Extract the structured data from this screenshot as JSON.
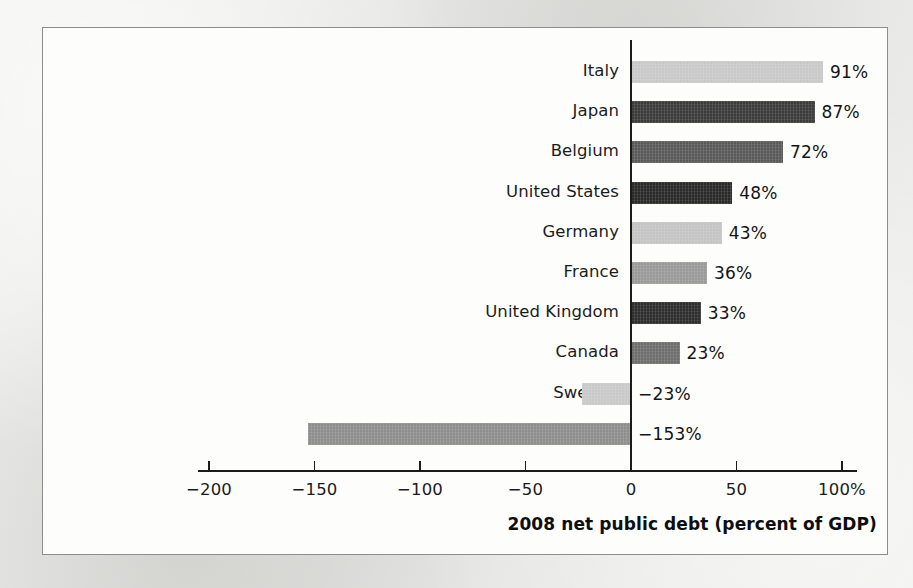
{
  "chart_data": {
    "type": "bar",
    "orientation": "horizontal",
    "title": "",
    "xlabel": "2008 net public debt (percent of GDP)",
    "ylabel": "",
    "categories": [
      "Italy",
      "Japan",
      "Belgium",
      "United States",
      "Germany",
      "France",
      "United Kingdom",
      "Canada",
      "Sweden",
      "Norway"
    ],
    "values": [
      91,
      87,
      72,
      48,
      43,
      36,
      33,
      23,
      -23,
      -153
    ],
    "value_labels": [
      "91%",
      "87%",
      "72%",
      "48%",
      "43%",
      "36%",
      "33%",
      "23%",
      "−23%",
      "−153%"
    ],
    "bar_colors": [
      "#c9c9c9",
      "#3c3c3c",
      "#5a5a5a",
      "#2a2a2a",
      "#c4c4c4",
      "#9a9a9a",
      "#2e2e2e",
      "#6e6e6e",
      "#c9c9c9",
      "#8e8e8e"
    ],
    "xlim": [
      -205,
      107
    ],
    "xticks": [
      -200,
      -150,
      -100,
      -50,
      0,
      50,
      100
    ],
    "xtick_labels": [
      "−200",
      "−150",
      "−100",
      "−50",
      "0",
      "50",
      "100%"
    ],
    "grid": false,
    "legend": false
  },
  "panel": {
    "border_color": "#8d8d8d",
    "background_color": "#fdfdfc"
  },
  "page": {
    "background_color": "#e8e8e6"
  }
}
